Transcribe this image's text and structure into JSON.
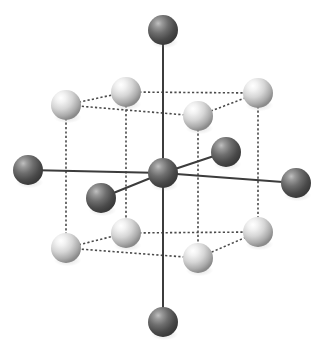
{
  "figure": {
    "width": 327,
    "height": 352,
    "background_color": "#ffffff"
  },
  "legend": {
    "dark_atom_name": "dark-atom",
    "light_atom_name": "light-atom",
    "solid_bond_name": "solid-bond",
    "dashed_edge_name": "dashed-cell-edge"
  },
  "style": {
    "dark_atom_highlight": "#b4b4b4",
    "dark_atom_mid": "#6e6e6e",
    "dark_atom_edge": "#3a3a3a",
    "light_atom_highlight": "#ffffff",
    "light_atom_mid": "#d8d8d8",
    "light_atom_edge": "#8a8a8a",
    "solid_bond_color": "#3c3c3c",
    "dashed_edge_color": "#4a4a4a",
    "solid_bond_width": 2,
    "dashed_edge_width": 1.6,
    "dash_pattern": "2.2 2.2"
  },
  "chart_data": {
    "type": "scatter",
    "xlabel": "",
    "ylabel": "",
    "xlim": [
      0,
      327
    ],
    "ylim": [
      0,
      352
    ],
    "grid": false,
    "legend_position": "none",
    "series": [
      {
        "name": "dark atoms",
        "color": "#6e6e6e",
        "radius": 15,
        "points": [
          {
            "id": "center",
            "label": "central-atom",
            "x": 163,
            "y": 173,
            "r": 15
          },
          {
            "id": "top",
            "label": "ligand-top",
            "x": 163,
            "y": 30,
            "r": 15
          },
          {
            "id": "bottom",
            "label": "ligand-bottom",
            "x": 163,
            "y": 322,
            "r": 15
          },
          {
            "id": "left",
            "label": "ligand-left",
            "x": 28,
            "y": 170,
            "r": 15
          },
          {
            "id": "right",
            "label": "ligand-right",
            "x": 296,
            "y": 183,
            "r": 15
          },
          {
            "id": "front",
            "label": "ligand-front-left",
            "x": 101,
            "y": 198,
            "r": 15
          },
          {
            "id": "back",
            "label": "ligand-back-right",
            "x": 226,
            "y": 152,
            "r": 15
          }
        ]
      },
      {
        "name": "light atoms",
        "color": "#d8d8d8",
        "radius": 15,
        "points": [
          {
            "id": "tfl",
            "label": "corner-top-front-left",
            "x": 66,
            "y": 105,
            "r": 15
          },
          {
            "id": "tbl",
            "label": "corner-top-back-left",
            "x": 126,
            "y": 92,
            "r": 15
          },
          {
            "id": "tbr",
            "label": "corner-top-back-right",
            "x": 258,
            "y": 93,
            "r": 15
          },
          {
            "id": "tfr",
            "label": "corner-top-front-right",
            "x": 198,
            "y": 116,
            "r": 15
          },
          {
            "id": "bfl",
            "label": "corner-bottom-front-left",
            "x": 66,
            "y": 248,
            "r": 15
          },
          {
            "id": "bbl",
            "label": "corner-bottom-back-left",
            "x": 126,
            "y": 233,
            "r": 15
          },
          {
            "id": "bbr",
            "label": "corner-bottom-back-right",
            "x": 258,
            "y": 232,
            "r": 15
          },
          {
            "id": "bfr",
            "label": "corner-bottom-front-right",
            "x": 198,
            "y": 258,
            "r": 15
          }
        ]
      }
    ],
    "solid_bonds": [
      {
        "name": "bond-center-top",
        "x1": 163,
        "y1": 173,
        "x2": 163,
        "y2": 30
      },
      {
        "name": "bond-center-bottom",
        "x1": 163,
        "y1": 173,
        "x2": 163,
        "y2": 322
      },
      {
        "name": "bond-center-left",
        "x1": 163,
        "y1": 173,
        "x2": 28,
        "y2": 170
      },
      {
        "name": "bond-center-right",
        "x1": 163,
        "y1": 173,
        "x2": 296,
        "y2": 183
      },
      {
        "name": "bond-center-front-left",
        "x1": 163,
        "y1": 173,
        "x2": 101,
        "y2": 198
      },
      {
        "name": "bond-center-back-right",
        "x1": 163,
        "y1": 173,
        "x2": 226,
        "y2": 152
      }
    ],
    "dashed_edges": [
      {
        "name": "edge-top-fl-bl",
        "x1": 66,
        "y1": 105,
        "x2": 126,
        "y2": 92
      },
      {
        "name": "edge-top-bl-br",
        "x1": 126,
        "y1": 92,
        "x2": 258,
        "y2": 93
      },
      {
        "name": "edge-top-br-fr",
        "x1": 258,
        "y1": 93,
        "x2": 198,
        "y2": 116
      },
      {
        "name": "edge-top-fr-fl",
        "x1": 198,
        "y1": 116,
        "x2": 66,
        "y2": 105
      },
      {
        "name": "edge-bottom-fl-bl",
        "x1": 66,
        "y1": 248,
        "x2": 126,
        "y2": 233
      },
      {
        "name": "edge-bottom-bl-br",
        "x1": 126,
        "y1": 233,
        "x2": 258,
        "y2": 232
      },
      {
        "name": "edge-bottom-br-fr",
        "x1": 258,
        "y1": 232,
        "x2": 198,
        "y2": 258
      },
      {
        "name": "edge-bottom-fr-fl",
        "x1": 198,
        "y1": 258,
        "x2": 66,
        "y2": 248
      },
      {
        "name": "edge-vert-fl",
        "x1": 66,
        "y1": 105,
        "x2": 66,
        "y2": 248
      },
      {
        "name": "edge-vert-bl",
        "x1": 126,
        "y1": 92,
        "x2": 126,
        "y2": 233
      },
      {
        "name": "edge-vert-br",
        "x1": 258,
        "y1": 93,
        "x2": 258,
        "y2": 232
      },
      {
        "name": "edge-vert-fr",
        "x1": 198,
        "y1": 116,
        "x2": 198,
        "y2": 258
      }
    ]
  }
}
